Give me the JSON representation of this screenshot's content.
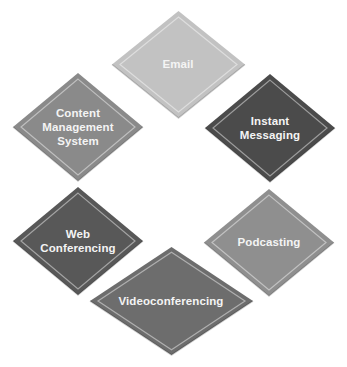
{
  "diagram": {
    "type": "cycle-of-diamonds",
    "nodes": [
      {
        "id": "email",
        "label": "Email",
        "color": "#c2c2c2",
        "cx": 178,
        "cy": 64,
        "w": 133,
        "h": 107
      },
      {
        "id": "instant-messaging",
        "label": "Instant\nMessaging",
        "color": "#4b4b4b",
        "cx": 270,
        "cy": 128,
        "w": 130,
        "h": 108
      },
      {
        "id": "podcasting",
        "label": "Podcasting",
        "color": "#8f8f8f",
        "cx": 269,
        "cy": 242,
        "w": 130,
        "h": 107
      },
      {
        "id": "videoconferencing",
        "label": "Videoconferencing",
        "color": "#6d6d6d",
        "cx": 171,
        "cy": 301,
        "w": 163,
        "h": 108
      },
      {
        "id": "web-conferencing",
        "label": "Web\nConferencing",
        "color": "#585858",
        "cx": 78,
        "cy": 241,
        "w": 130,
        "h": 108
      },
      {
        "id": "content-management-system",
        "label": "Content\nManagement\nSystem",
        "color": "#8a8a8a",
        "cx": 78,
        "cy": 127,
        "w": 130,
        "h": 108
      }
    ]
  }
}
